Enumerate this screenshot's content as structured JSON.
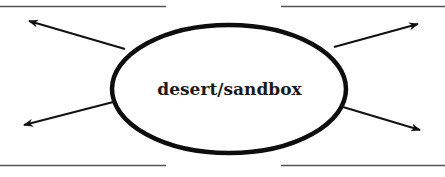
{
  "diagram": {
    "type": "web-organizer",
    "center_label": "desert/sandbox",
    "colors": {
      "stroke": "#111111",
      "line": "#555555",
      "background": "#ffffff"
    },
    "blank_lines": [
      {
        "position": "top-left"
      },
      {
        "position": "top-right"
      },
      {
        "position": "bottom-left"
      },
      {
        "position": "bottom-right"
      }
    ],
    "arrows": [
      {
        "direction": "up-left"
      },
      {
        "direction": "up-right"
      },
      {
        "direction": "down-left"
      },
      {
        "direction": "down-right"
      }
    ]
  }
}
